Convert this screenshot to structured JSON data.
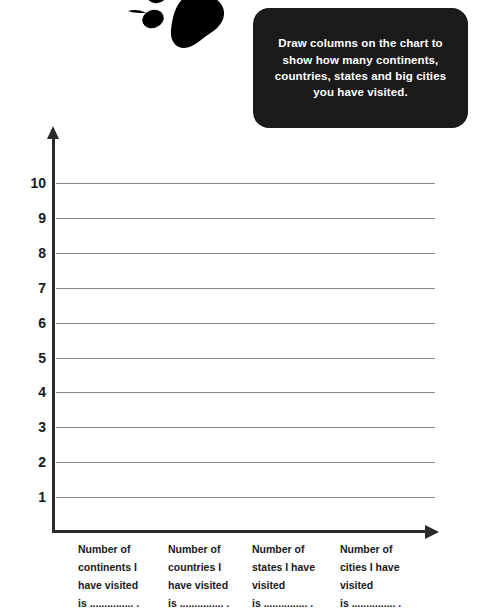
{
  "decoration": {
    "paw_icon": "paw-print-icon"
  },
  "instruction": {
    "text": "Draw columns on the chart to show how many continents, countries, states and big cities you have visited."
  },
  "chart_data": {
    "type": "bar",
    "title": "",
    "subtitle": "",
    "xlabel": "",
    "ylabel": "",
    "grid": true,
    "legend": false,
    "ylim": [
      0,
      10
    ],
    "yticks": [
      "1",
      "2",
      "3",
      "4",
      "5",
      "6",
      "7",
      "8",
      "9",
      "10"
    ],
    "categories": [
      "Number of continents I have visited is ............... .",
      "Number of countries I have visited is ............... .",
      "Number of states I have visited is ............... .",
      "Number of cities I have visited is ............... ."
    ],
    "values": [
      0,
      0,
      0,
      0
    ],
    "note": "Blank worksheet chart - no columns drawn yet"
  },
  "categories_wrapped": [
    {
      "lines": [
        "Number of",
        "continents I",
        "have visited",
        "is ............... ."
      ]
    },
    {
      "lines": [
        "Number of",
        "countries I",
        "have visited",
        "is ............... ."
      ]
    },
    {
      "lines": [
        "Number of",
        "states I have",
        "visited",
        "is ............... ."
      ]
    },
    {
      "lines": [
        "Number of",
        "cities I have",
        "visited",
        "is ............... ."
      ]
    }
  ],
  "axis": {
    "y_labels": [
      "10",
      "9",
      "8",
      "7",
      "6",
      "5",
      "4",
      "3",
      "2",
      "1"
    ]
  },
  "colors": {
    "axis": "#2b2b2b",
    "gridline": "#8a8a8a",
    "callout_background": "#1a1a1a",
    "callout_text": "#ffffff",
    "page_background": "#ffffff",
    "ink": "#1a1a1a"
  }
}
